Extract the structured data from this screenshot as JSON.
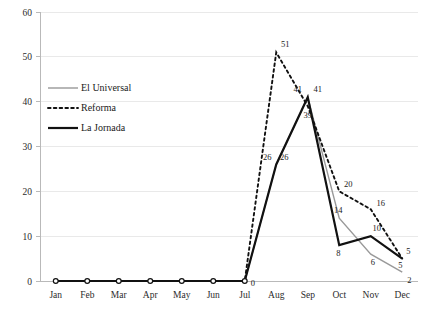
{
  "chart_data": {
    "type": "line",
    "title": "",
    "subtitle": "",
    "xlabel": "",
    "ylabel": "",
    "categories": [
      "Jan",
      "Feb",
      "Mar",
      "Apr",
      "May",
      "Jun",
      "Jul",
      "Aug",
      "Sep",
      "Oct",
      "Nov",
      "Dec"
    ],
    "ylim": [
      0,
      60
    ],
    "yticks": [
      0,
      10,
      20,
      30,
      40,
      50,
      60
    ],
    "grid": true,
    "legend_position": "inside-upper-left",
    "series": [
      {
        "name": "El Universal",
        "style": "solid",
        "color": "#999999",
        "width": 1.4,
        "values": [
          0,
          0,
          0,
          0,
          0,
          0,
          0,
          26,
          41,
          14,
          6,
          2
        ],
        "labels": [
          "",
          "",
          "",
          "",
          "",
          "",
          "",
          "26",
          "41",
          "14",
          "6",
          "2"
        ]
      },
      {
        "name": "Reforma",
        "style": "dotted",
        "color": "#111111",
        "width": 1.9,
        "values": [
          0,
          0,
          0,
          0,
          0,
          0,
          0,
          51,
          39,
          20,
          16,
          5
        ],
        "labels": [
          "",
          "",
          "",
          "",
          "",
          "",
          "",
          "51",
          "39",
          "20",
          "16",
          "5"
        ]
      },
      {
        "name": "La Jornada",
        "style": "solid",
        "color": "#111111",
        "width": 2.2,
        "values": [
          0,
          0,
          0,
          0,
          0,
          0,
          0,
          26,
          41,
          8,
          10,
          5
        ],
        "labels": [
          "",
          "",
          "",
          "",
          "",
          "",
          "0",
          "26",
          "41",
          "8",
          "10",
          "5"
        ]
      }
    ]
  },
  "axes": {
    "y_tick_labels": [
      "0",
      "10",
      "20",
      "30",
      "40",
      "50",
      "60"
    ],
    "x_tick_labels": [
      "Jan",
      "Feb",
      "Mar",
      "Apr",
      "May",
      "Jun",
      "Jul",
      "Aug",
      "Sep",
      "Oct",
      "Nov",
      "Dec"
    ]
  },
  "legend": {
    "items": [
      {
        "label": "El Universal"
      },
      {
        "label": "Reforma"
      },
      {
        "label": "La Jornada"
      }
    ]
  },
  "annotations": {
    "zero_marker_label": "0",
    "peak_reforma_label": "51",
    "sep_eluniversal_label": "41",
    "sep_lajornada_label": "41",
    "sep_reforma_label": "39",
    "aug_eluniversal_label": "26",
    "aug_lajornada_label": "26",
    "oct_reforma_label": "20",
    "oct_eluniversal_label": "14",
    "oct_lajornada_label": "8",
    "nov_reforma_label": "16",
    "nov_lajornada_label": "10",
    "nov_eluniversal_label": "6",
    "dec_reforma_label": "5",
    "dec_lajornada_label": "5",
    "dec_eluniversal_label": "2"
  }
}
